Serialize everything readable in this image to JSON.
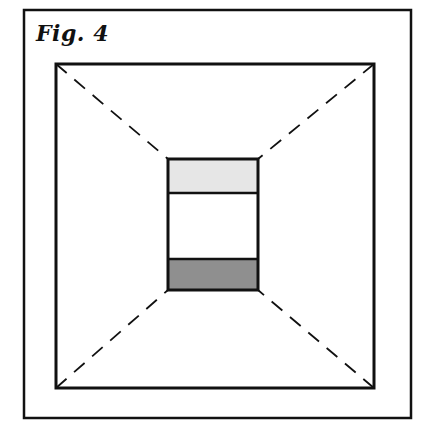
{
  "figure": {
    "title": "Fig. 4",
    "colors": {
      "line": "#111111",
      "top_band": "#e6e6e6",
      "middle_band": "#ffffff",
      "bottom_band": "#8f8f8f",
      "background": "#ffffff"
    },
    "frame": {
      "x": 24,
      "y": 10,
      "w": 387,
      "h": 408
    },
    "outer_square": {
      "x": 56,
      "y": 64,
      "w": 318,
      "h": 324
    },
    "inner_box": {
      "x": 168,
      "y": 159,
      "w": 90,
      "h": 131
    },
    "bands": [
      {
        "name": "top-light-band",
        "y": 159,
        "h": 34
      },
      {
        "name": "middle-white-band",
        "y": 193,
        "h": 66
      },
      {
        "name": "bottom-dark-band",
        "y": 259,
        "h": 31
      }
    ]
  }
}
